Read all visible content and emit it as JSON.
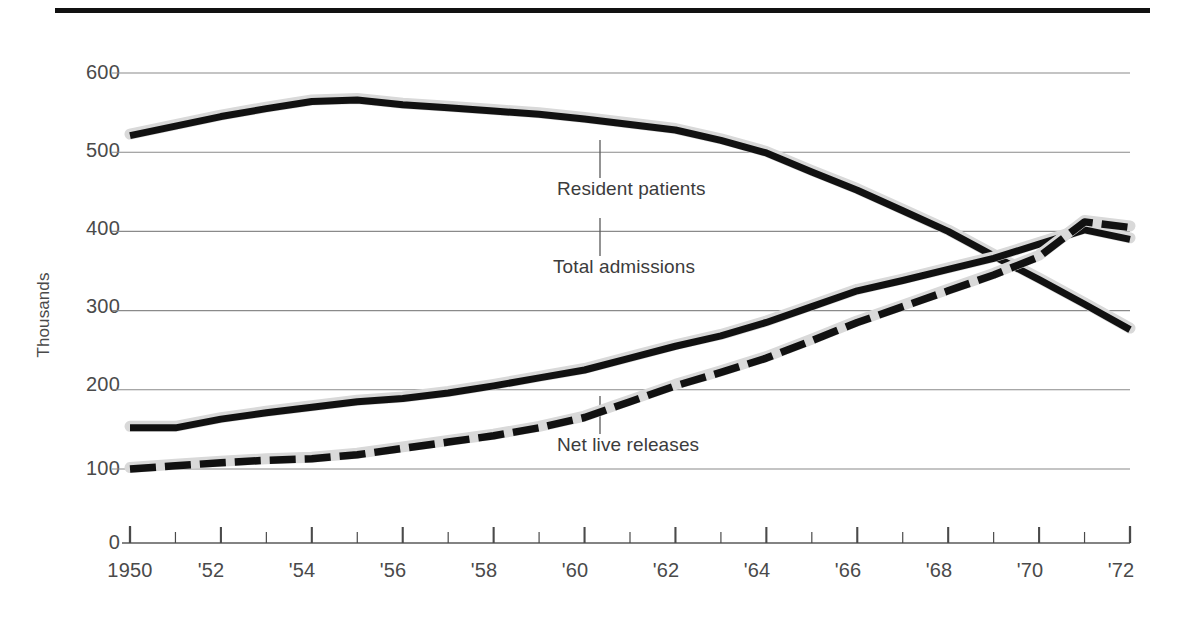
{
  "figure": {
    "top_rule_color": "#111111",
    "background_color": "#ffffff",
    "gridline_color": "#8a8a8a",
    "series_color": "#111111",
    "halo_color": "#d9d9d9"
  },
  "axes": {
    "ylabel": "Thousands",
    "y_ticks": [
      "0",
      "100",
      "200",
      "300",
      "400",
      "500",
      "600"
    ],
    "x_ticks_labeled": [
      "1950",
      "'52",
      "'54",
      "'56",
      "'58",
      "'60",
      "'62",
      "'64",
      "'66",
      "'68",
      "'70",
      "'72"
    ],
    "x_all_years": [
      1950,
      1951,
      1952,
      1953,
      1954,
      1955,
      1956,
      1957,
      1958,
      1959,
      1960,
      1961,
      1962,
      1963,
      1964,
      1965,
      1966,
      1967,
      1968,
      1969,
      1970,
      1971,
      1972
    ],
    "y_axis_break": true
  },
  "annotations": {
    "resident_patients": "Resident patients",
    "total_admissions": "Total admissions",
    "net_live_releases": "Net live releases"
  },
  "chart_data": {
    "type": "line",
    "title": "",
    "subtitle": "",
    "xlabel": "",
    "ylabel": "Thousands",
    "xlim": [
      1950,
      1972
    ],
    "ylim": [
      100,
      600
    ],
    "y_axis_break_below": 100,
    "grid": true,
    "legend_position": "inline-annotations",
    "x": [
      1950,
      1951,
      1952,
      1953,
      1954,
      1955,
      1956,
      1957,
      1958,
      1959,
      1960,
      1961,
      1962,
      1963,
      1964,
      1965,
      1966,
      1967,
      1968,
      1969,
      1970,
      1971,
      1972
    ],
    "series": [
      {
        "name": "Resident patients",
        "style": "solid",
        "values": [
          521,
          533,
          545,
          555,
          564,
          566,
          560,
          556,
          552,
          548,
          542,
          535,
          528,
          515,
          499,
          475,
          452,
          426,
          400,
          369,
          339,
          308,
          276
        ]
      },
      {
        "name": "Total admissions",
        "style": "solid",
        "values": [
          152,
          152,
          163,
          171,
          178,
          185,
          189,
          196,
          205,
          215,
          225,
          240,
          255,
          268,
          285,
          305,
          325,
          338,
          352,
          366,
          384,
          402,
          390
        ]
      },
      {
        "name": "Net live releases",
        "style": "dashed",
        "values": [
          100,
          104,
          108,
          111,
          113,
          118,
          126,
          134,
          142,
          152,
          165,
          185,
          205,
          222,
          240,
          262,
          285,
          305,
          325,
          345,
          368,
          412,
          405
        ]
      }
    ]
  }
}
